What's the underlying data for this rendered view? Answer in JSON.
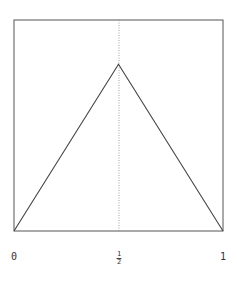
{
  "chart_data": {
    "type": "line",
    "title": "",
    "xlabel": "",
    "ylabel": "",
    "x": [
      0,
      0.5,
      1
    ],
    "series": [
      {
        "name": "tent",
        "values": [
          0,
          0.79,
          0
        ]
      }
    ],
    "xlim": [
      0,
      1
    ],
    "ylim": [
      0,
      1
    ],
    "x_tick_labels": [
      "0",
      "1/2",
      "1"
    ],
    "reference_line": {
      "orientation": "vertical",
      "x": 0.5,
      "style": "dotted"
    },
    "grid": false,
    "legend": null
  },
  "axis": {
    "tick_0": "0",
    "tick_half_num": "1",
    "tick_half_den": "2",
    "tick_1": "1"
  },
  "colors": {
    "frame": "#555555",
    "line": "#444444",
    "dotted": "#888888"
  }
}
